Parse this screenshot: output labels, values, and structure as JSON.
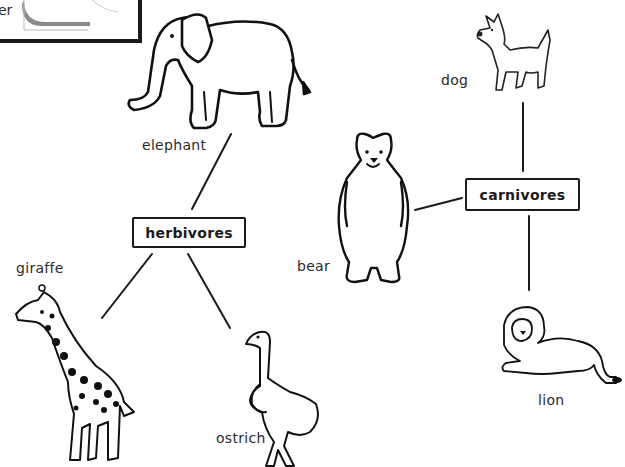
{
  "corner_card": {
    "partial_text": "er"
  },
  "categories": {
    "herbivores": {
      "label": "herbivores"
    },
    "carnivores": {
      "label": "carnivores"
    }
  },
  "animals": {
    "elephant": {
      "label": "elephant",
      "group": "herbivores"
    },
    "giraffe": {
      "label": "giraffe",
      "group": "herbivores"
    },
    "ostrich": {
      "label": "ostrich",
      "group": "herbivores"
    },
    "dog": {
      "label": "dog",
      "group": "carnivores"
    },
    "bear": {
      "label": "bear",
      "group": "carnivores"
    },
    "lion": {
      "label": "lion",
      "group": "carnivores"
    }
  },
  "colors": {
    "ink": "#1a1a1a",
    "paper": "#ffffff",
    "card_shade": "#8a8a8a"
  }
}
